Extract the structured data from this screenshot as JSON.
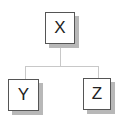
{
  "diagram": {
    "type": "tree",
    "root": {
      "label": "X",
      "children": [
        {
          "label": "Y"
        },
        {
          "label": "Z"
        }
      ]
    },
    "nodes": [
      {
        "id": "x",
        "label": "X"
      },
      {
        "id": "y",
        "label": "Y"
      },
      {
        "id": "z",
        "label": "Z"
      }
    ],
    "edges": [
      {
        "from": "X",
        "to": "Y"
      },
      {
        "from": "X",
        "to": "Z"
      }
    ],
    "colors": {
      "node_border": "#555555",
      "node_shadow": "#b8b8b8",
      "connector": "#c8c8c8",
      "text": "#222222"
    }
  }
}
